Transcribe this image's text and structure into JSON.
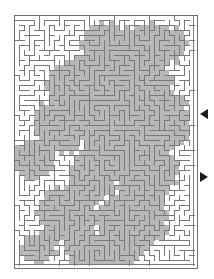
{
  "figure": {
    "name": "maze-puzzle",
    "background_color": "#ffffff"
  },
  "maze": {
    "name": "maze-grid",
    "columns": 36,
    "rows": 50,
    "cell_size_px": 5,
    "origin_x_px": 14,
    "origin_y_px": 15,
    "width_px": 184,
    "height_px": 254,
    "wall_color": "#7a7a7a",
    "wall_thickness_px": 1,
    "border_color": "#6e6e6e",
    "passage_color": "#ffffff",
    "shaded_passage_color": "#b8b8b8",
    "shaded_passage_edge_color": "#9a9a9a",
    "shading_note": "Irregular blob-shaped grey shaded regions cover roughly half of the maze interior, concentrated in the centre, upper-right and lower-right areas."
  },
  "markers": {
    "entrance": {
      "name": "entrance-arrow",
      "glyph": "left-triangle",
      "direction": "left",
      "color": "#1c1c1c",
      "x_px": 200,
      "y_px": 114,
      "edge": "right"
    },
    "exit": {
      "name": "exit-arrow",
      "glyph": "right-triangle",
      "direction": "right",
      "color": "#1c1c1c",
      "x_px": 200,
      "y_px": 177,
      "edge": "right"
    }
  },
  "chart_data": {
    "type": "maze",
    "title": "",
    "grid": {
      "cols": 36,
      "rows": 50
    },
    "shaded_blobs": [
      {
        "cx": 0.52,
        "cy": 0.13,
        "rx": 0.16,
        "ry": 0.1
      },
      {
        "cx": 0.78,
        "cy": 0.12,
        "rx": 0.18,
        "ry": 0.09
      },
      {
        "cx": 0.36,
        "cy": 0.28,
        "rx": 0.18,
        "ry": 0.11
      },
      {
        "cx": 0.66,
        "cy": 0.3,
        "rx": 0.22,
        "ry": 0.14
      },
      {
        "cx": 0.26,
        "cy": 0.44,
        "rx": 0.15,
        "ry": 0.12
      },
      {
        "cx": 0.58,
        "cy": 0.47,
        "rx": 0.22,
        "ry": 0.13
      },
      {
        "cx": 0.86,
        "cy": 0.42,
        "rx": 0.12,
        "ry": 0.12
      },
      {
        "cx": 0.1,
        "cy": 0.58,
        "rx": 0.12,
        "ry": 0.08
      },
      {
        "cx": 0.44,
        "cy": 0.64,
        "rx": 0.14,
        "ry": 0.1
      },
      {
        "cx": 0.74,
        "cy": 0.62,
        "rx": 0.18,
        "ry": 0.12
      },
      {
        "cx": 0.3,
        "cy": 0.8,
        "rx": 0.17,
        "ry": 0.12
      },
      {
        "cx": 0.66,
        "cy": 0.82,
        "rx": 0.2,
        "ry": 0.13
      },
      {
        "cx": 0.5,
        "cy": 0.95,
        "rx": 0.22,
        "ry": 0.07
      },
      {
        "cx": 0.14,
        "cy": 0.93,
        "rx": 0.1,
        "ry": 0.06
      }
    ],
    "markers": [
      {
        "label": "entrance",
        "side": "right",
        "y_fraction": 0.39,
        "direction": "left"
      },
      {
        "label": "exit",
        "side": "right",
        "y_fraction": 0.64,
        "direction": "right"
      }
    ]
  }
}
